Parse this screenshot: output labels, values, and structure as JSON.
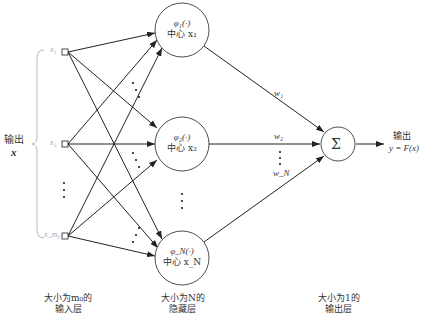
{
  "input": {
    "label": "输出",
    "var": "x",
    "nodes": [
      "x1",
      "x2",
      "xm0"
    ],
    "node_labels": [
      "x₁",
      "x₂",
      "x_m₀"
    ],
    "caption_line1": "大小为m₀的",
    "caption_line2": "输入层"
  },
  "hidden": {
    "nodes": [
      {
        "func": "φ₁(·)",
        "center": "中心 x₁"
      },
      {
        "func": "φ₂(·)",
        "center": "中心 x₂"
      },
      {
        "func": "φ_N(·)",
        "center": "中心 x_N"
      }
    ],
    "caption_line1": "大小为N的",
    "caption_line2": "隐藏层"
  },
  "weights": [
    "w₁",
    "w₂",
    "w_N"
  ],
  "output": {
    "symbol": "Σ",
    "label": "输出",
    "formula": "y = F(x)",
    "caption_line1": "大小为1的",
    "caption_line2": "输出层"
  },
  "colors": {
    "line": "#222222",
    "brace": "#bbbbbb",
    "text": "#333333"
  }
}
